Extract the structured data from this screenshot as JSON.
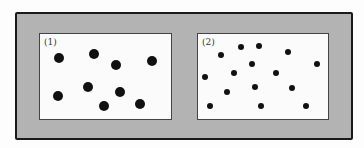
{
  "figure": {
    "colors": {
      "frame": "#b3b3b3",
      "border": "#1a1a1a",
      "panel": "#fbfbfb",
      "dot": "#111111"
    },
    "panels": [
      {
        "label": "(1)",
        "dot_size": "large",
        "dot_count": 9,
        "dots": [
          [
            59,
            58
          ],
          [
            94,
            54
          ],
          [
            116,
            65
          ],
          [
            152,
            61
          ],
          [
            58,
            96
          ],
          [
            88,
            87
          ],
          [
            120,
            92
          ],
          [
            104,
            106
          ],
          [
            140,
            104
          ]
        ]
      },
      {
        "label": "(2)",
        "dot_size": "small",
        "dot_count": 15,
        "dots": [
          [
            221,
            55
          ],
          [
            241,
            47
          ],
          [
            259,
            46
          ],
          [
            288,
            52
          ],
          [
            317,
            64
          ],
          [
            205,
            77
          ],
          [
            252,
            64
          ],
          [
            234,
            73
          ],
          [
            276,
            73
          ],
          [
            227,
            92
          ],
          [
            255,
            87
          ],
          [
            292,
            88
          ],
          [
            210,
            106
          ],
          [
            261,
            106
          ],
          [
            306,
            106
          ]
        ]
      }
    ]
  }
}
